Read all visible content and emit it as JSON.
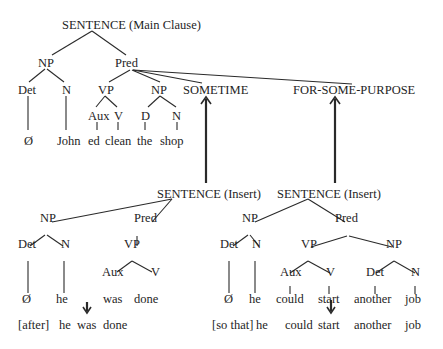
{
  "main_clause": {
    "root": "SENTENCE (Main Clause)",
    "np": "NP",
    "pred": "Pred",
    "det": "Det",
    "n": "N",
    "vp": "VP",
    "aux": "Aux",
    "v": "V",
    "np2": "NP",
    "d": "D",
    "n2": "N",
    "sometime": "SOMETIME",
    "for_some_purpose": "FOR-SOME-PURPOSE",
    "leaves": [
      "Ø",
      "John",
      "ed",
      "clean",
      "the",
      "shop"
    ]
  },
  "insert_left": {
    "root": "SENTENCE (Insert)",
    "np": "NP",
    "pred": "Pred",
    "det": "Det",
    "n": "N",
    "vp": "VP",
    "aux": "Aux",
    "v": "V",
    "leaves": [
      "Ø",
      "he",
      "was",
      "done"
    ],
    "surface": [
      "[after]",
      "he",
      "was",
      "done"
    ]
  },
  "insert_right": {
    "root": "SENTENCE (Insert)",
    "np": "NP",
    "pred": "Pred",
    "det": "Det",
    "n": "N",
    "vp": "VP",
    "aux": "Aux",
    "v": "V",
    "np2": "NP",
    "det2": "Det",
    "n2": "N",
    "leaves": [
      "Ø",
      "he",
      "could",
      "start",
      "another",
      "job"
    ],
    "surface": [
      "[so that]",
      "he",
      "could",
      "start",
      "another",
      "job"
    ]
  }
}
